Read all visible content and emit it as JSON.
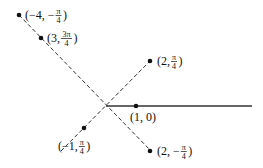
{
  "diagram": {
    "type": "polar-coordinates-plot",
    "polar_axis": {
      "label": "polar axis",
      "from": [
        106,
        106
      ],
      "to": [
        252,
        106
      ]
    },
    "lines": [
      {
        "name": "line-3pi4",
        "from": [
          19,
          15
        ],
        "to": [
          151,
          151
        ],
        "style": "dashed"
      },
      {
        "name": "line-pi4",
        "from": [
          61,
          151
        ],
        "to": [
          150,
          61
        ],
        "style": "dashed"
      }
    ],
    "points": [
      {
        "name": "point-neg4-negpi4",
        "r": "-4",
        "theta": "-π/4",
        "pos": [
          19,
          15
        ],
        "label": {
          "pre": "(−4, −",
          "num": "π",
          "den": "4",
          "post": ")"
        },
        "label_pos": [
          25,
          19
        ]
      },
      {
        "name": "point-3-3pi4",
        "r": "3",
        "theta": "3π/4",
        "pos": [
          41,
          38
        ],
        "label": {
          "pre": "(3, ",
          "num": "3π",
          "den": "4",
          "post": ")"
        },
        "label_pos": [
          47,
          42
        ]
      },
      {
        "name": "point-2-pi4",
        "r": "2",
        "theta": "π/4",
        "pos": [
          150,
          61
        ],
        "label": {
          "pre": "(2, ",
          "num": "π",
          "den": "4",
          "post": ")"
        },
        "label_pos": [
          157,
          65
        ]
      },
      {
        "name": "point-1-0",
        "r": "1",
        "theta": "0",
        "pos": [
          136,
          106
        ],
        "label": {
          "pre": "(1, 0)",
          "num": "",
          "den": "",
          "post": ""
        },
        "label_pos": [
          130,
          121
        ]
      },
      {
        "name": "point-neg1-pi4",
        "r": "-1",
        "theta": "π/4",
        "pos": [
          84,
          128
        ],
        "label": {
          "pre": "(−1, ",
          "num": "π",
          "den": "4",
          "post": ")"
        },
        "label_pos": [
          58,
          150
        ]
      },
      {
        "name": "point-2-negpi4",
        "r": "2",
        "theta": "−π/4",
        "pos": [
          150,
          151
        ],
        "label": {
          "pre": "(2, −",
          "num": "π",
          "den": "4",
          "post": ")"
        },
        "label_pos": [
          157,
          155
        ]
      }
    ]
  }
}
